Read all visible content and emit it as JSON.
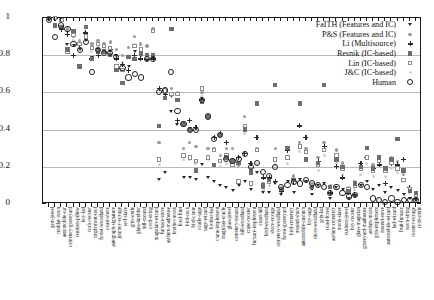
{
  "figure": {
    "y_axis_label": "Similarity value",
    "y_ticks": [
      "0",
      "0.2",
      "0.4",
      "0.6",
      "0.8",
      "1"
    ]
  },
  "legend": {
    "entries": [
      {
        "label": "FaITH (Features and IC)",
        "marker": "faith"
      },
      {
        "label": "P&S (Features and IC)",
        "marker": "ps"
      },
      {
        "label": "Li (Multisource)",
        "marker": "li"
      },
      {
        "label": "Resnik (IC-based)",
        "marker": "resnik"
      },
      {
        "label": "Lin (IC-based)",
        "marker": "lin"
      },
      {
        "label": "J&C (IC-based)",
        "marker": "jc"
      },
      {
        "label": "Human",
        "marker": "human"
      }
    ]
  },
  "chart_data": {
    "type": "scatter",
    "title": "",
    "xlabel": "",
    "ylabel": "Similarity value",
    "ylim": [
      0,
      1
    ],
    "yticks": [
      0,
      0.2,
      0.4,
      0.6,
      0.8,
      1
    ],
    "grid": "horizontal",
    "legend_position": "top-right",
    "categories": [
      "gem-jewel",
      "midday-noon",
      "automobile-car",
      "cemetery-graveyard",
      "cushion-pillow",
      "boy-lad",
      "cock-rooster",
      "implement-tool",
      "forest-woodland",
      "coast-shore",
      "autograph-signature",
      "journey-voyage",
      "serf-slave",
      "grin-smile",
      "glass-tumbler",
      "hill-mound",
      "cord-string",
      "magician-wizard",
      "furnace-stove",
      "asylum-madhouse",
      "brother-monk",
      "food-fruit",
      "bird-cock",
      "bird-crane",
      "oracle-sage",
      "sage-wizard",
      "brother-lad",
      "crane-implement",
      "magician-oracle",
      "glass-jewel",
      "cemetery-mound",
      "hill-woodland",
      "crane-rooster",
      "furnace-implement",
      "coast-hill",
      "bird-woodland",
      "shore-voyage",
      "cemetery-woodland",
      "forest-graveyard",
      "bird-cemetery",
      "mound-shore",
      "automobile-cushion",
      "boy-sage",
      "shore-woodland",
      "grin-lad",
      "coast-forest",
      "asylum-cemetery",
      "monk-slave",
      "cushion-jewel",
      "boy-rooster",
      "glass-magician",
      "graveyard-madhouse",
      "asylum-monk",
      "grin-implement",
      "mound-stove",
      "automobile-wizard",
      "lad-wizard",
      "fruit-furnace",
      "noon-string",
      "rooster-voyage",
      "cord-smile"
    ],
    "series": [
      {
        "name": "Human",
        "marker": "human",
        "values": [
          0.99,
          0.9,
          0.96,
          0.94,
          0.86,
          0.83,
          0.87,
          0.71,
          0.83,
          0.81,
          0.81,
          0.79,
          0.73,
          0.68,
          0.7,
          0.68,
          0.78,
          0.78,
          0.6,
          0.61,
          0.71,
          0.5,
          0.43,
          0.4,
          0.4,
          0.56,
          0.47,
          0.35,
          0.37,
          0.24,
          0.23,
          0.24,
          0.27,
          0.2,
          0.22,
          0.17,
          0.15,
          0.2,
          0.09,
          0.1,
          0.12,
          0.11,
          0.13,
          0.11,
          0.1,
          0.09,
          0.06,
          0.09,
          0.06,
          0.04,
          0.05,
          0.1,
          0.09,
          0.03,
          0.02,
          0.01,
          0.03,
          0.01,
          0.02,
          0.02,
          0.02
        ]
      },
      {
        "name": "Resnik (IC-based)",
        "marker": "resnik",
        "values": [
          1.0,
          0.96,
          0.95,
          0.83,
          0.93,
          0.74,
          0.95,
          0.78,
          0.82,
          0.82,
          0.8,
          0.72,
          0.65,
          0.79,
          0.78,
          0.81,
          0.8,
          0.8,
          0.42,
          0.57,
          0.94,
          0.56,
          0.43,
          0.4,
          0.18,
          0.55,
          0.47,
          0.21,
          0.37,
          0.25,
          0.23,
          0.22,
          0.4,
          0.17,
          0.54,
          0.1,
          0.13,
          0.64,
          0.08,
          0.3,
          0.13,
          0.54,
          0.24,
          0.09,
          0.22,
          0.64,
          0.09,
          0.24,
          0.2,
          0.07,
          0.11,
          0.2,
          0.3,
          0.19,
          0.25,
          0.19,
          0.24,
          0.35,
          0.18,
          0.07,
          0.06
        ]
      },
      {
        "name": "Lin (IC-based)",
        "marker": "lin",
        "values": [
          1.0,
          1.0,
          0.99,
          0.82,
          0.91,
          0.86,
          0.9,
          0.84,
          0.86,
          0.85,
          0.84,
          0.74,
          0.72,
          0.79,
          0.85,
          0.83,
          0.79,
          0.93,
          0.24,
          0.61,
          0.59,
          0.59,
          0.26,
          0.25,
          0.23,
          0.62,
          0.25,
          0.29,
          0.23,
          0.26,
          0.21,
          0.12,
          0.42,
          0.11,
          0.29,
          0.09,
          0.12,
          0.24,
          0.08,
          0.25,
          0.13,
          0.31,
          0.28,
          0.09,
          0.21,
          0.29,
          0.09,
          0.26,
          0.19,
          0.08,
          0.1,
          0.19,
          0.25,
          0.18,
          0.23,
          0.18,
          0.22,
          0.19,
          0.13,
          0.08,
          0.05
        ]
      },
      {
        "name": "Li (Multisource)",
        "marker": "li",
        "values": [
          1.0,
          1.0,
          0.94,
          0.91,
          0.8,
          0.86,
          0.92,
          0.78,
          0.8,
          0.82,
          0.83,
          0.78,
          0.75,
          0.72,
          0.8,
          0.78,
          0.78,
          0.78,
          0.62,
          0.59,
          0.59,
          0.45,
          0.43,
          0.45,
          0.41,
          0.56,
          0.47,
          0.36,
          0.38,
          0.33,
          0.23,
          0.25,
          0.27,
          0.22,
          0.36,
          0.14,
          0.14,
          0.12,
          0.07,
          0.29,
          0.12,
          0.42,
          0.36,
          0.09,
          0.23,
          0.31,
          0.06,
          0.2,
          0.14,
          0.06,
          0.05,
          0.22,
          0.25,
          0.19,
          0.21,
          0.11,
          0.22,
          0.21,
          0.24,
          0.09,
          0.03
        ]
      },
      {
        "name": "P&S (Features and IC)",
        "marker": "ps",
        "values": [
          1.0,
          1.0,
          0.99,
          0.94,
          0.9,
          0.88,
          0.92,
          0.86,
          0.88,
          0.86,
          0.87,
          0.83,
          0.8,
          0.84,
          0.9,
          0.86,
          0.85,
          0.94,
          0.33,
          0.62,
          0.62,
          0.6,
          0.3,
          0.33,
          0.31,
          0.6,
          0.3,
          0.3,
          0.26,
          0.3,
          0.3,
          0.21,
          0.47,
          0.19,
          0.3,
          0.11,
          0.13,
          0.3,
          0.09,
          0.3,
          0.15,
          0.33,
          0.3,
          0.11,
          0.25,
          0.33,
          0.1,
          0.29,
          0.22,
          0.09,
          0.12,
          0.2,
          0.3,
          0.21,
          0.25,
          0.19,
          0.25,
          0.23,
          0.16,
          0.09,
          0.06
        ]
      },
      {
        "name": "FaITH (Features and IC)",
        "marker": "faith",
        "values": [
          1.0,
          1.0,
          0.95,
          0.86,
          0.85,
          0.83,
          0.88,
          0.79,
          0.83,
          0.82,
          0.82,
          0.8,
          0.72,
          0.74,
          0.82,
          0.8,
          0.78,
          0.78,
          0.13,
          0.17,
          0.5,
          0.43,
          0.14,
          0.14,
          0.13,
          0.21,
          0.14,
          0.12,
          0.1,
          0.09,
          0.07,
          0.1,
          0.12,
          0.08,
          0.17,
          0.06,
          0.06,
          0.11,
          0.05,
          0.12,
          0.06,
          0.13,
          0.12,
          0.05,
          0.1,
          0.11,
          0.03,
          0.09,
          0.08,
          0.03,
          0.04,
          0.1,
          0.12,
          0.08,
          0.1,
          0.06,
          0.09,
          0.07,
          0.05,
          0.03,
          0.02
        ]
      },
      {
        "name": "J&C (IC-based)",
        "marker": "jc",
        "values": [
          1.0,
          1.0,
          0.96,
          0.93,
          0.88,
          0.84,
          0.9,
          0.82,
          0.85,
          0.84,
          0.84,
          0.8,
          0.76,
          0.8,
          0.86,
          0.82,
          0.8,
          0.8,
          0.21,
          0.58,
          0.58,
          0.56,
          0.24,
          0.24,
          0.22,
          0.58,
          0.24,
          0.21,
          0.2,
          0.22,
          0.2,
          0.11,
          0.38,
          0.1,
          0.22,
          0.08,
          0.1,
          0.21,
          0.06,
          0.22,
          0.11,
          0.28,
          0.24,
          0.08,
          0.18,
          0.26,
          0.05,
          0.22,
          0.16,
          0.06,
          0.08,
          0.16,
          0.22,
          0.15,
          0.2,
          0.15,
          0.19,
          0.17,
          0.12,
          0.06,
          0.04
        ]
      }
    ]
  }
}
